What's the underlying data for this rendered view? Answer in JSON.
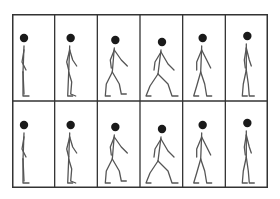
{
  "figure": {
    "rows": 2,
    "cols": 6,
    "colors": {
      "border": "#333333",
      "figure": "#555555",
      "head": "#1a1a1a",
      "background": "#ffffff"
    },
    "frames": [
      {
        "row": 0,
        "col": 0,
        "pose": "stand"
      },
      {
        "row": 0,
        "col": 1,
        "pose": "lift"
      },
      {
        "row": 0,
        "col": 2,
        "pose": "step"
      },
      {
        "row": 0,
        "col": 3,
        "pose": "stride"
      },
      {
        "row": 0,
        "col": 4,
        "pose": "pass"
      },
      {
        "row": 0,
        "col": 5,
        "pose": "upright"
      },
      {
        "row": 1,
        "col": 0,
        "pose": "stand"
      },
      {
        "row": 1,
        "col": 1,
        "pose": "lift"
      },
      {
        "row": 1,
        "col": 2,
        "pose": "step"
      },
      {
        "row": 1,
        "col": 3,
        "pose": "stride"
      },
      {
        "row": 1,
        "col": 4,
        "pose": "pass"
      },
      {
        "row": 1,
        "col": 5,
        "pose": "upright"
      }
    ]
  }
}
